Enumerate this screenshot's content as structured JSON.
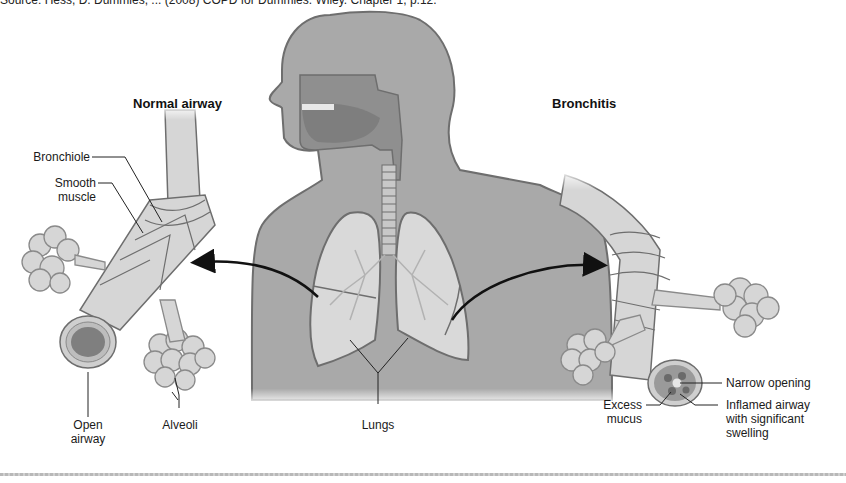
{
  "caption": "Source: Hess, D. Dummies, ... (2008) COPD for Dummies. Wiley. Chapter 1, p.12.",
  "panels": {
    "left": {
      "title": "Normal airway",
      "labels": {
        "bronchiole": "Bronchiole",
        "smooth_muscle": "Smooth\nmuscle",
        "open_airway": "Open\nairway",
        "alveoli": "Alveoli"
      }
    },
    "center": {
      "labels": {
        "lungs": "Lungs"
      }
    },
    "right": {
      "title": "Bronchitis",
      "labels": {
        "narrow_opening": "Narrow opening",
        "excess_mucus": "Excess\nmucus",
        "inflamed_airway": "Inflamed airway\nwith significant\nswelling"
      }
    }
  },
  "colors": {
    "body_fill": "#a9a9a9",
    "lung_fill": "#d9d9d9",
    "airway_fill": "#d6d6d6",
    "outline": "#6e6e6e",
    "leader": "#222222"
  }
}
